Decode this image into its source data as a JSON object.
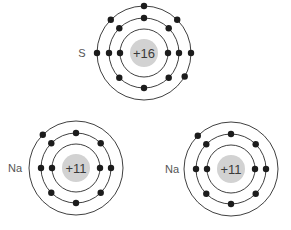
{
  "diagram": {
    "type": "bohr-atomic-models",
    "colors": {
      "shell": "#2a2a2a",
      "nucleus": "#d2d2d2",
      "electron": "#1c1c1c",
      "charge_text": "#3a3a3a",
      "symbol_text": "#555555"
    },
    "atoms": [
      {
        "symbol": "S",
        "charge": "+16",
        "center": [
          144,
          53
        ],
        "label_pos": [
          82,
          53
        ],
        "shell_radii": [
          24,
          35,
          47
        ],
        "electrons_per_shell": [
          2,
          8,
          6
        ],
        "electron_angles": [
          [
            180,
            0
          ],
          [
            90,
            135,
            45,
            180,
            0,
            225,
            270,
            315
          ],
          [
            90,
            135,
            45,
            180,
            0,
            330
          ]
        ]
      },
      {
        "symbol": "Na",
        "charge": "+11",
        "center": [
          76,
          168
        ],
        "label_pos": [
          15,
          168
        ],
        "shell_radii": [
          24,
          35,
          47
        ],
        "electrons_per_shell": [
          2,
          8,
          1
        ],
        "electron_angles": [
          [
            180,
            0
          ],
          [
            90,
            135,
            45,
            180,
            0,
            225,
            270,
            315
          ],
          [
            135
          ]
        ]
      },
      {
        "symbol": "Na",
        "charge": "+11",
        "center": [
          231,
          169
        ],
        "label_pos": [
          172,
          169
        ],
        "shell_radii": [
          24,
          35,
          47
        ],
        "electrons_per_shell": [
          2,
          8,
          1
        ],
        "electron_angles": [
          [
            180,
            0
          ],
          [
            90,
            135,
            45,
            180,
            0,
            225,
            270,
            315
          ],
          [
            135
          ]
        ]
      }
    ]
  }
}
